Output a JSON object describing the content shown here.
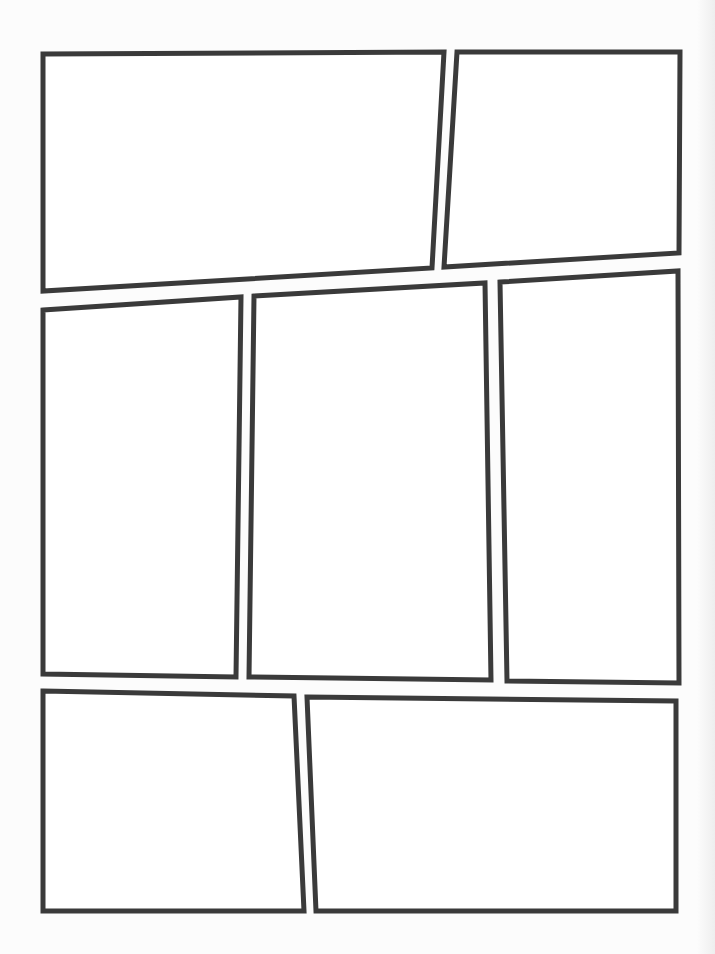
{
  "page": {
    "width": 715,
    "height": 954,
    "background": "#fcfcfc",
    "border_color": "#3a3a3a",
    "panel_fill": "#ffffff",
    "border_width": 5
  },
  "panels": [
    {
      "id": "panel-1",
      "row": 1,
      "points": "43,54 444,52 432,268 43,291"
    },
    {
      "id": "panel-2",
      "row": 1,
      "points": "457,52 680,52 679,253 444,267"
    },
    {
      "id": "panel-3",
      "row": 2,
      "points": "43,310 241,297 236,677 43,674"
    },
    {
      "id": "panel-4",
      "row": 2,
      "points": "254,296 485,283 491,680 249,677"
    },
    {
      "id": "panel-5",
      "row": 2,
      "points": "500,282 678,271 679,683 507,681"
    },
    {
      "id": "panel-6",
      "row": 3,
      "points": "43,691 294,696 304,911 43,911"
    },
    {
      "id": "panel-7",
      "row": 3,
      "points": "307,697 676,701 676,911 316,911"
    }
  ]
}
